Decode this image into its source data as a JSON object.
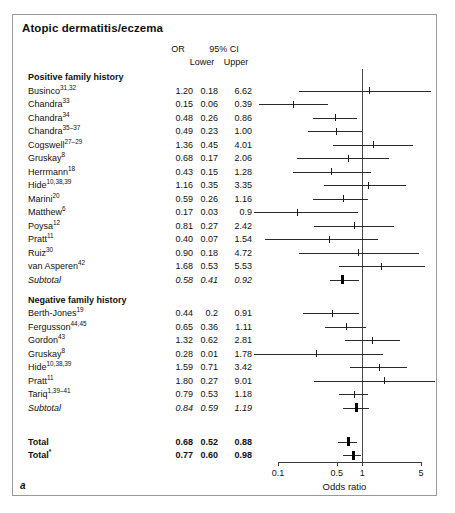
{
  "figure": {
    "title": "Atopic dermatitis/eczema",
    "panel_letter": "a"
  },
  "columns": {
    "or": "OR",
    "ci": "95% CI",
    "lower": "Lower",
    "upper": "Upper"
  },
  "axis": {
    "title": "Odds ratio",
    "scale": "log",
    "ticks": [
      "0.1",
      "0.5",
      "1",
      "5"
    ],
    "tick_values": [
      0.1,
      0.5,
      1,
      5
    ],
    "xlim": [
      0.08,
      7.0
    ],
    "reference_value": 1
  },
  "groups": [
    {
      "heading": "Positive family history",
      "rows": [
        {
          "label": "Businco",
          "ref": "31,32",
          "or": "1.20",
          "lower": "0.18",
          "upper": "6.62",
          "or_v": 1.2,
          "lo_v": 0.18,
          "up_v": 6.62,
          "kind": "study"
        },
        {
          "label": "Chandra",
          "ref": "33",
          "or": "0.15",
          "lower": "0.06",
          "upper": "0.39",
          "or_v": 0.15,
          "lo_v": 0.06,
          "up_v": 0.39,
          "kind": "study"
        },
        {
          "label": "Chandra",
          "ref": "34",
          "or": "0.48",
          "lower": "0.26",
          "upper": "0.86",
          "or_v": 0.48,
          "lo_v": 0.26,
          "up_v": 0.86,
          "kind": "study"
        },
        {
          "label": "Chandra",
          "ref": "35–37",
          "or": "0.49",
          "lower": "0.23",
          "upper": "1.00",
          "or_v": 0.49,
          "lo_v": 0.23,
          "up_v": 1.0,
          "kind": "study"
        },
        {
          "label": "Cogswell",
          "ref": "27–29",
          "or": "1.36",
          "lower": "0.45",
          "upper": "4.01",
          "or_v": 1.36,
          "lo_v": 0.45,
          "up_v": 4.01,
          "kind": "study"
        },
        {
          "label": "Gruskay",
          "ref": "8",
          "or": "0.68",
          "lower": "0.17",
          "upper": "2.06",
          "or_v": 0.68,
          "lo_v": 0.17,
          "up_v": 2.06,
          "kind": "study"
        },
        {
          "label": "Herrmann",
          "ref": "18",
          "or": "0.43",
          "lower": "0.15",
          "upper": "1.28",
          "or_v": 0.43,
          "lo_v": 0.15,
          "up_v": 1.28,
          "kind": "study"
        },
        {
          "label": "Hide",
          "ref": "10,38,39",
          "or": "1.16",
          "lower": "0.35",
          "upper": "3.35",
          "or_v": 1.16,
          "lo_v": 0.35,
          "up_v": 3.35,
          "kind": "study"
        },
        {
          "label": "Marini",
          "ref": "20",
          "or": "0.59",
          "lower": "0.26",
          "upper": "1.16",
          "or_v": 0.59,
          "lo_v": 0.26,
          "up_v": 1.16,
          "kind": "study"
        },
        {
          "label": "Matthew",
          "ref": "6",
          "or": "0.17",
          "lower": "0.03",
          "upper": "0.9",
          "or_v": 0.17,
          "lo_v": 0.03,
          "up_v": 0.9,
          "kind": "study"
        },
        {
          "label": "Poysa",
          "ref": "12",
          "or": "0.81",
          "lower": "0.27",
          "upper": "2.42",
          "or_v": 0.81,
          "lo_v": 0.27,
          "up_v": 2.42,
          "kind": "study"
        },
        {
          "label": "Pratt",
          "ref": "11",
          "or": "0.40",
          "lower": "0.07",
          "upper": "1.54",
          "or_v": 0.4,
          "lo_v": 0.07,
          "up_v": 1.54,
          "kind": "study"
        },
        {
          "label": "Ruiz",
          "ref": "30",
          "or": "0.90",
          "lower": "0.18",
          "upper": "4.72",
          "or_v": 0.9,
          "lo_v": 0.18,
          "up_v": 4.72,
          "kind": "study"
        },
        {
          "label": "van Asperen",
          "ref": "42",
          "or": "1.68",
          "lower": "0.53",
          "upper": "5.53",
          "or_v": 1.68,
          "lo_v": 0.53,
          "up_v": 5.53,
          "kind": "study"
        },
        {
          "label": "Subtotal",
          "ref": "",
          "or": "0.58",
          "lower": "0.41",
          "upper": "0.92",
          "or_v": 0.58,
          "lo_v": 0.41,
          "up_v": 0.92,
          "kind": "subtotal"
        }
      ]
    },
    {
      "heading": "Negative family history",
      "rows": [
        {
          "label": "Berth-Jones",
          "ref": "19",
          "or": "0.44",
          "lower": "0.2",
          "upper": "0.91",
          "or_v": 0.44,
          "lo_v": 0.2,
          "up_v": 0.91,
          "kind": "study"
        },
        {
          "label": "Fergusson",
          "ref": "44,45",
          "or": "0.65",
          "lower": "0.36",
          "upper": "1.11",
          "or_v": 0.65,
          "lo_v": 0.36,
          "up_v": 1.11,
          "kind": "study"
        },
        {
          "label": "Gordon",
          "ref": "43",
          "or": "1.32",
          "lower": "0.62",
          "upper": "2.81",
          "or_v": 1.32,
          "lo_v": 0.62,
          "up_v": 2.81,
          "kind": "study"
        },
        {
          "label": "Gruskay",
          "ref": "8",
          "or": "0.28",
          "lower": "0.01",
          "upper": "1.78",
          "or_v": 0.28,
          "lo_v": 0.01,
          "up_v": 1.78,
          "kind": "study"
        },
        {
          "label": "Hide",
          "ref": "10,38,39",
          "or": "1.59",
          "lower": "0.71",
          "upper": "3.42",
          "or_v": 1.59,
          "lo_v": 0.71,
          "up_v": 3.42,
          "kind": "study"
        },
        {
          "label": "Pratt",
          "ref": "11",
          "or": "1.80",
          "lower": "0.27",
          "upper": "9.01",
          "or_v": 1.8,
          "lo_v": 0.27,
          "up_v": 9.01,
          "kind": "study"
        },
        {
          "label": "Tariq",
          "ref": "1,39–41",
          "or": "0.79",
          "lower": "0.53",
          "upper": "1.18",
          "or_v": 0.79,
          "lo_v": 0.53,
          "up_v": 1.18,
          "kind": "study"
        },
        {
          "label": "Subtotal",
          "ref": "",
          "or": "0.84",
          "lower": "0.59",
          "upper": "1.19",
          "or_v": 0.84,
          "lo_v": 0.59,
          "up_v": 1.19,
          "kind": "subtotal"
        }
      ]
    },
    {
      "heading": "",
      "rows": [
        {
          "label": "Total",
          "ref": "",
          "or": "0.68",
          "lower": "0.52",
          "upper": "0.88",
          "or_v": 0.68,
          "lo_v": 0.52,
          "up_v": 0.88,
          "kind": "total"
        },
        {
          "label": "Total",
          "ref": "*",
          "or": "0.77",
          "lower": "0.60",
          "upper": "0.98",
          "or_v": 0.77,
          "lo_v": 0.6,
          "up_v": 0.98,
          "kind": "total"
        }
      ]
    }
  ],
  "chart_data": {
    "type": "forest",
    "title": "Atopic dermatitis/eczema",
    "xlabel": "Odds ratio",
    "ylabel": "",
    "xscale": "log",
    "xlim": [
      0.08,
      7.0
    ],
    "xticks": [
      0.1,
      0.5,
      1,
      5
    ],
    "xticklabels": [
      "0.1",
      "0.5",
      "1",
      "5"
    ],
    "reference_line": 1,
    "grid": false,
    "legend": "none",
    "effect_measure": "Odds ratio",
    "series": [
      {
        "name": "Positive family history",
        "points": [
          {
            "study": "Businco31,32",
            "or": 1.2,
            "ci_low": 0.18,
            "ci_high": 6.62
          },
          {
            "study": "Chandra33",
            "or": 0.15,
            "ci_low": 0.06,
            "ci_high": 0.39
          },
          {
            "study": "Chandra34",
            "or": 0.48,
            "ci_low": 0.26,
            "ci_high": 0.86
          },
          {
            "study": "Chandra35-37",
            "or": 0.49,
            "ci_low": 0.23,
            "ci_high": 1.0
          },
          {
            "study": "Cogswell27-29",
            "or": 1.36,
            "ci_low": 0.45,
            "ci_high": 4.01
          },
          {
            "study": "Gruskay8",
            "or": 0.68,
            "ci_low": 0.17,
            "ci_high": 2.06
          },
          {
            "study": "Herrmann18",
            "or": 0.43,
            "ci_low": 0.15,
            "ci_high": 1.28
          },
          {
            "study": "Hide10,38,39",
            "or": 1.16,
            "ci_low": 0.35,
            "ci_high": 3.35
          },
          {
            "study": "Marini20",
            "or": 0.59,
            "ci_low": 0.26,
            "ci_high": 1.16
          },
          {
            "study": "Matthew6",
            "or": 0.17,
            "ci_low": 0.03,
            "ci_high": 0.9
          },
          {
            "study": "Poysa12",
            "or": 0.81,
            "ci_low": 0.27,
            "ci_high": 2.42
          },
          {
            "study": "Pratt11",
            "or": 0.4,
            "ci_low": 0.07,
            "ci_high": 1.54
          },
          {
            "study": "Ruiz30",
            "or": 0.9,
            "ci_low": 0.18,
            "ci_high": 4.72
          },
          {
            "study": "van Asperen42",
            "or": 1.68,
            "ci_low": 0.53,
            "ci_high": 5.53
          },
          {
            "study": "Subtotal",
            "or": 0.58,
            "ci_low": 0.41,
            "ci_high": 0.92
          }
        ]
      },
      {
        "name": "Negative family history",
        "points": [
          {
            "study": "Berth-Jones19",
            "or": 0.44,
            "ci_low": 0.2,
            "ci_high": 0.91
          },
          {
            "study": "Fergusson44,45",
            "or": 0.65,
            "ci_low": 0.36,
            "ci_high": 1.11
          },
          {
            "study": "Gordon43",
            "or": 1.32,
            "ci_low": 0.62,
            "ci_high": 2.81
          },
          {
            "study": "Gruskay8",
            "or": 0.28,
            "ci_low": 0.01,
            "ci_high": 1.78
          },
          {
            "study": "Hide10,38,39",
            "or": 1.59,
            "ci_low": 0.71,
            "ci_high": 3.42
          },
          {
            "study": "Pratt11",
            "or": 1.8,
            "ci_low": 0.27,
            "ci_high": 9.01
          },
          {
            "study": "Tariq1,39-41",
            "or": 0.79,
            "ci_low": 0.53,
            "ci_high": 1.18
          },
          {
            "study": "Subtotal",
            "or": 0.84,
            "ci_low": 0.59,
            "ci_high": 1.19
          }
        ]
      },
      {
        "name": "Overall",
        "points": [
          {
            "study": "Total",
            "or": 0.68,
            "ci_low": 0.52,
            "ci_high": 0.88
          },
          {
            "study": "Total*",
            "or": 0.77,
            "ci_low": 0.6,
            "ci_high": 0.98
          }
        ]
      }
    ]
  }
}
